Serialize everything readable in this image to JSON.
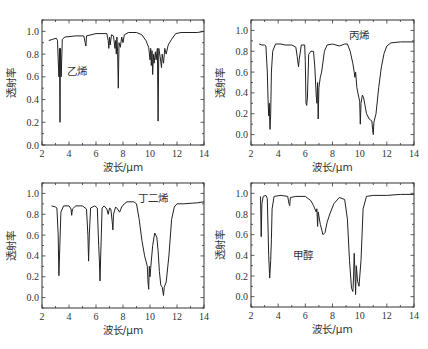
{
  "figure": {
    "x_label": "波长/μm",
    "y_label": "透射率"
  },
  "chart_data": [
    {
      "type": "line",
      "name": "乙烯",
      "annotation": "乙烯",
      "xlabel": "波长/μm",
      "ylabel": "透射率",
      "xlim": [
        2,
        14
      ],
      "ylim": [
        0.0,
        1.1
      ],
      "xticks": [
        2,
        4,
        6,
        8,
        10,
        12,
        14
      ],
      "yticks": [
        0.0,
        0.2,
        0.4,
        0.6,
        0.8,
        1.0
      ],
      "ytick_labels": [
        "0.0",
        "0.2",
        "0.4",
        "0.6",
        "0.8",
        "1.0"
      ],
      "box": {
        "x": 42,
        "y": 20,
        "w": 162,
        "h": 125
      },
      "label_pos": [
        3.85,
        0.62
      ],
      "points": [
        [
          2.5,
          0.92
        ],
        [
          2.8,
          0.93
        ],
        [
          3.05,
          0.94
        ],
        [
          3.15,
          0.92
        ],
        [
          3.2,
          0.75
        ],
        [
          3.25,
          0.6
        ],
        [
          3.3,
          0.85
        ],
        [
          3.33,
          0.2
        ],
        [
          3.36,
          0.85
        ],
        [
          3.42,
          0.6
        ],
        [
          3.5,
          0.93
        ],
        [
          3.7,
          0.95
        ],
        [
          4.5,
          0.96
        ],
        [
          5.1,
          0.96
        ],
        [
          5.2,
          0.9
        ],
        [
          5.25,
          0.87
        ],
        [
          5.3,
          0.96
        ],
        [
          6.0,
          0.98
        ],
        [
          6.8,
          0.98
        ],
        [
          6.9,
          0.92
        ],
        [
          6.95,
          0.85
        ],
        [
          7.0,
          0.95
        ],
        [
          7.05,
          0.88
        ],
        [
          7.15,
          0.97
        ],
        [
          7.3,
          0.96
        ],
        [
          7.4,
          0.85
        ],
        [
          7.45,
          0.92
        ],
        [
          7.5,
          0.8
        ],
        [
          7.55,
          0.95
        ],
        [
          7.6,
          0.82
        ],
        [
          7.65,
          0.5
        ],
        [
          7.7,
          0.9
        ],
        [
          7.8,
          0.86
        ],
        [
          7.9,
          0.95
        ],
        [
          8.0,
          0.9
        ],
        [
          8.1,
          0.97
        ],
        [
          8.4,
          0.99
        ],
        [
          9.0,
          0.99
        ],
        [
          9.4,
          0.97
        ],
        [
          9.7,
          0.92
        ],
        [
          9.9,
          0.86
        ],
        [
          10.0,
          0.75
        ],
        [
          10.05,
          0.85
        ],
        [
          10.1,
          0.7
        ],
        [
          10.15,
          0.83
        ],
        [
          10.2,
          0.62
        ],
        [
          10.25,
          0.8
        ],
        [
          10.3,
          0.72
        ],
        [
          10.4,
          0.82
        ],
        [
          10.45,
          0.75
        ],
        [
          10.55,
          0.85
        ],
        [
          10.6,
          0.21
        ],
        [
          10.65,
          0.85
        ],
        [
          10.75,
          0.78
        ],
        [
          10.85,
          0.68
        ],
        [
          10.9,
          0.8
        ],
        [
          11.0,
          0.72
        ],
        [
          11.1,
          0.85
        ],
        [
          11.2,
          0.8
        ],
        [
          11.35,
          0.88
        ],
        [
          11.6,
          0.93
        ],
        [
          11.9,
          0.98
        ],
        [
          12.3,
          0.99
        ],
        [
          13.5,
          0.99
        ],
        [
          14.0,
          1.0
        ]
      ]
    },
    {
      "type": "line",
      "name": "丙烯",
      "annotation": "丙烯",
      "xlabel": "波长/μm",
      "ylabel": "透射率",
      "xlim": [
        2,
        14
      ],
      "ylim": [
        -0.1,
        1.1
      ],
      "xticks": [
        2,
        4,
        6,
        8,
        10,
        12,
        14
      ],
      "yticks": [
        0.0,
        0.2,
        0.4,
        0.6,
        0.8,
        1.0
      ],
      "ytick_labels": [
        "0.0",
        "0.2",
        "0.4",
        "0.6",
        "0.8",
        "1.0"
      ],
      "box": {
        "x": 251,
        "y": 20,
        "w": 163,
        "h": 125
      },
      "label_pos": [
        9.2,
        0.92
      ],
      "points": [
        [
          2.6,
          0.87
        ],
        [
          2.8,
          0.86
        ],
        [
          3.0,
          0.86
        ],
        [
          3.1,
          0.85
        ],
        [
          3.2,
          0.6
        ],
        [
          3.25,
          0.35
        ],
        [
          3.3,
          0.18
        ],
        [
          3.35,
          0.3
        ],
        [
          3.4,
          0.05
        ],
        [
          3.45,
          0.2
        ],
        [
          3.5,
          0.6
        ],
        [
          3.6,
          0.8
        ],
        [
          3.8,
          0.87
        ],
        [
          4.2,
          0.87
        ],
        [
          4.5,
          0.86
        ],
        [
          5.0,
          0.86
        ],
        [
          5.3,
          0.84
        ],
        [
          5.4,
          0.75
        ],
        [
          5.5,
          0.65
        ],
        [
          5.55,
          0.72
        ],
        [
          5.7,
          0.86
        ],
        [
          5.95,
          0.86
        ],
        [
          6.0,
          0.7
        ],
        [
          6.05,
          0.3
        ],
        [
          6.1,
          0.28
        ],
        [
          6.15,
          0.35
        ],
        [
          6.25,
          0.77
        ],
        [
          6.4,
          0.8
        ],
        [
          6.6,
          0.8
        ],
        [
          6.7,
          0.65
        ],
        [
          6.8,
          0.38
        ],
        [
          6.85,
          0.3
        ],
        [
          6.9,
          0.5
        ],
        [
          6.95,
          0.15
        ],
        [
          7.0,
          0.45
        ],
        [
          7.1,
          0.55
        ],
        [
          7.2,
          0.6
        ],
        [
          7.4,
          0.8
        ],
        [
          7.6,
          0.86
        ],
        [
          8.0,
          0.87
        ],
        [
          8.5,
          0.85
        ],
        [
          8.9,
          0.87
        ],
        [
          9.1,
          0.87
        ],
        [
          9.3,
          0.8
        ],
        [
          9.5,
          0.68
        ],
        [
          9.6,
          0.6
        ],
        [
          9.65,
          0.55
        ],
        [
          9.7,
          0.6
        ],
        [
          9.8,
          0.45
        ],
        [
          9.9,
          0.38
        ],
        [
          10.0,
          0.32
        ],
        [
          10.05,
          0.1
        ],
        [
          10.1,
          0.3
        ],
        [
          10.2,
          0.38
        ],
        [
          10.3,
          0.35
        ],
        [
          10.5,
          0.2
        ],
        [
          10.7,
          0.15
        ],
        [
          10.9,
          0.13
        ],
        [
          10.95,
          0.05
        ],
        [
          11.0,
          0.0
        ],
        [
          11.05,
          0.12
        ],
        [
          11.2,
          0.2
        ],
        [
          11.4,
          0.45
        ],
        [
          11.6,
          0.65
        ],
        [
          11.8,
          0.78
        ],
        [
          12.0,
          0.85
        ],
        [
          12.3,
          0.88
        ],
        [
          13.0,
          0.89
        ],
        [
          14.0,
          0.89
        ]
      ]
    },
    {
      "type": "line",
      "name": "丁二烯",
      "annotation": "丁二烯",
      "xlabel": "波长/μm",
      "ylabel": "透射率",
      "xlim": [
        2,
        14
      ],
      "ylim": [
        -0.1,
        1.1
      ],
      "xticks": [
        2,
        4,
        6,
        8,
        10,
        12,
        14
      ],
      "yticks": [
        0.0,
        0.2,
        0.4,
        0.6,
        0.8,
        1.0
      ],
      "ytick_labels": [
        "0.0",
        "0.2",
        "0.4",
        "0.6",
        "0.8",
        "1.0"
      ],
      "box": {
        "x": 42,
        "y": 183,
        "w": 162,
        "h": 125
      },
      "label_pos": [
        9.1,
        0.92
      ],
      "points": [
        [
          2.7,
          0.88
        ],
        [
          3.0,
          0.87
        ],
        [
          3.1,
          0.86
        ],
        [
          3.2,
          0.6
        ],
        [
          3.25,
          0.21
        ],
        [
          3.3,
          0.4
        ],
        [
          3.4,
          0.82
        ],
        [
          3.6,
          0.88
        ],
        [
          4.0,
          0.88
        ],
        [
          4.15,
          0.85
        ],
        [
          4.2,
          0.79
        ],
        [
          4.25,
          0.85
        ],
        [
          4.5,
          0.88
        ],
        [
          5.0,
          0.88
        ],
        [
          5.3,
          0.85
        ],
        [
          5.4,
          0.6
        ],
        [
          5.45,
          0.35
        ],
        [
          5.5,
          0.6
        ],
        [
          5.6,
          0.86
        ],
        [
          5.9,
          0.88
        ],
        [
          6.1,
          0.86
        ],
        [
          6.2,
          0.5
        ],
        [
          6.25,
          0.35
        ],
        [
          6.3,
          0.16
        ],
        [
          6.35,
          0.4
        ],
        [
          6.45,
          0.86
        ],
        [
          6.6,
          0.88
        ],
        [
          6.8,
          0.85
        ],
        [
          6.9,
          0.8
        ],
        [
          7.0,
          0.86
        ],
        [
          7.1,
          0.85
        ],
        [
          7.2,
          0.73
        ],
        [
          7.25,
          0.65
        ],
        [
          7.3,
          0.8
        ],
        [
          7.45,
          0.87
        ],
        [
          7.6,
          0.85
        ],
        [
          7.75,
          0.82
        ],
        [
          7.9,
          0.87
        ],
        [
          8.1,
          0.9
        ],
        [
          8.3,
          0.92
        ],
        [
          8.8,
          0.92
        ],
        [
          9.0,
          0.9
        ],
        [
          9.2,
          0.75
        ],
        [
          9.4,
          0.55
        ],
        [
          9.6,
          0.4
        ],
        [
          9.8,
          0.3
        ],
        [
          9.85,
          0.15
        ],
        [
          9.9,
          0.08
        ],
        [
          9.95,
          0.3
        ],
        [
          10.0,
          0.2
        ],
        [
          10.05,
          0.28
        ],
        [
          10.1,
          0.35
        ],
        [
          10.2,
          0.5
        ],
        [
          10.35,
          0.62
        ],
        [
          10.5,
          0.58
        ],
        [
          10.6,
          0.45
        ],
        [
          10.7,
          0.25
        ],
        [
          10.8,
          0.12
        ],
        [
          10.9,
          0.1
        ],
        [
          11.0,
          0.02
        ],
        [
          11.05,
          0.1
        ],
        [
          11.2,
          0.15
        ],
        [
          11.4,
          0.4
        ],
        [
          11.6,
          0.75
        ],
        [
          11.8,
          0.87
        ],
        [
          12.0,
          0.9
        ],
        [
          12.5,
          0.9
        ],
        [
          13.5,
          0.91
        ],
        [
          14.0,
          0.92
        ]
      ]
    },
    {
      "type": "line",
      "name": "甲醇",
      "annotation": "甲醇",
      "xlabel": "波长/μm",
      "ylabel": "透射率",
      "xlim": [
        2,
        14
      ],
      "ylim": [
        -0.1,
        1.1
      ],
      "xticks": [
        2,
        4,
        6,
        8,
        10,
        12,
        14
      ],
      "yticks": [
        0.0,
        0.2,
        0.4,
        0.6,
        0.8,
        1.0
      ],
      "ytick_labels": [
        "0.0",
        "0.2",
        "0.4",
        "0.6",
        "0.8",
        "1.0"
      ],
      "box": {
        "x": 251,
        "y": 183,
        "w": 163,
        "h": 124
      },
      "label_pos": [
        5.1,
        0.36
      ],
      "points": [
        [
          2.7,
          0.97
        ],
        [
          2.75,
          0.58
        ],
        [
          2.8,
          0.9
        ],
        [
          2.9,
          0.97
        ],
        [
          3.1,
          0.98
        ],
        [
          3.2,
          0.95
        ],
        [
          3.3,
          0.4
        ],
        [
          3.38,
          0.18
        ],
        [
          3.45,
          0.35
        ],
        [
          3.5,
          0.55
        ],
        [
          3.55,
          0.85
        ],
        [
          3.7,
          0.97
        ],
        [
          4.2,
          0.98
        ],
        [
          4.7,
          0.97
        ],
        [
          4.8,
          0.9
        ],
        [
          4.85,
          0.88
        ],
        [
          4.9,
          0.96
        ],
        [
          5.3,
          0.97
        ],
        [
          6.0,
          0.97
        ],
        [
          6.4,
          0.93
        ],
        [
          6.6,
          0.88
        ],
        [
          6.8,
          0.82
        ],
        [
          6.85,
          0.85
        ],
        [
          6.9,
          0.68
        ],
        [
          6.95,
          0.82
        ],
        [
          7.1,
          0.7
        ],
        [
          7.3,
          0.6
        ],
        [
          7.45,
          0.62
        ],
        [
          7.6,
          0.72
        ],
        [
          7.8,
          0.8
        ],
        [
          8.1,
          0.9
        ],
        [
          8.5,
          0.96
        ],
        [
          8.9,
          0.94
        ],
        [
          9.1,
          0.75
        ],
        [
          9.25,
          0.35
        ],
        [
          9.4,
          0.08
        ],
        [
          9.5,
          0.05
        ],
        [
          9.55,
          0.2
        ],
        [
          9.6,
          0.42
        ],
        [
          9.65,
          0.25
        ],
        [
          9.7,
          0.02
        ],
        [
          9.75,
          0.3
        ],
        [
          9.85,
          0.15
        ],
        [
          9.95,
          0.1
        ],
        [
          10.1,
          0.35
        ],
        [
          10.25,
          0.85
        ],
        [
          10.5,
          0.97
        ],
        [
          11.0,
          0.98
        ],
        [
          12.0,
          0.98
        ],
        [
          13.0,
          0.99
        ],
        [
          14.0,
          0.99
        ]
      ]
    }
  ]
}
